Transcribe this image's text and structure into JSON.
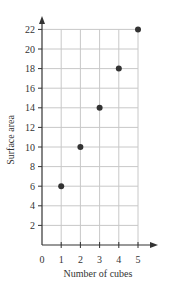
{
  "chart_data": {
    "type": "scatter",
    "title": "",
    "xlabel": "Number of cubes",
    "ylabel": "Surface area",
    "x": [
      1,
      2,
      3,
      4,
      5
    ],
    "y": [
      6,
      10,
      14,
      18,
      22
    ],
    "points": [
      {
        "x": 1,
        "y": 6
      },
      {
        "x": 2,
        "y": 10
      },
      {
        "x": 3,
        "y": 14
      },
      {
        "x": 4,
        "y": 18
      },
      {
        "x": 5,
        "y": 22
      }
    ],
    "xlim": [
      0,
      5
    ],
    "ylim": [
      0,
      22
    ],
    "x_ticks": [
      "0",
      "1",
      "2",
      "3",
      "4",
      "5"
    ],
    "y_ticks": [
      "2",
      "4",
      "6",
      "8",
      "10",
      "12",
      "14",
      "16",
      "18",
      "20",
      "22"
    ],
    "grid": true,
    "legend": null
  },
  "colors": {
    "axis": "#333333",
    "grid": "#c8c8c8",
    "point": "#333333",
    "text": "#333333"
  }
}
